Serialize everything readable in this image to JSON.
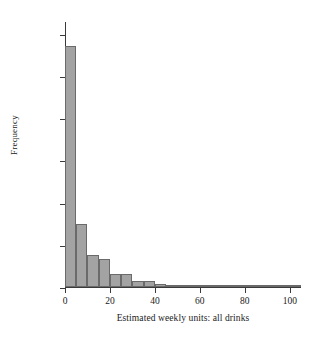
{
  "chart_data": {
    "type": "bar",
    "title": "",
    "xlabel": "Estimated weekly units: all drinks",
    "ylabel": "Frequency",
    "xlim": [
      0,
      105
    ],
    "ylim": [
      0,
      6300
    ],
    "grid": false,
    "legend": null,
    "bin_width": 5,
    "bin_starts": [
      0,
      5,
      10,
      15,
      20,
      25,
      30,
      35,
      40,
      45,
      50,
      55,
      60,
      65,
      70,
      75,
      80,
      85,
      90,
      95,
      100
    ],
    "categories": [
      "0-5",
      "5-10",
      "10-15",
      "15-20",
      "20-25",
      "25-30",
      "30-35",
      "35-40",
      "40-45",
      "45-50",
      "50-55",
      "55-60",
      "60-65",
      "65-70",
      "70-75",
      "75-80",
      "80-85",
      "85-90",
      "90-95",
      "95-100",
      "100-105"
    ],
    "values": [
      5700,
      1500,
      760,
      660,
      300,
      310,
      150,
      145,
      80,
      35,
      50,
      10,
      8,
      6,
      5,
      4,
      3,
      3,
      2,
      2,
      2
    ],
    "xticks": [
      0,
      20,
      40,
      60,
      80,
      100
    ],
    "xtick_labels": [
      "0",
      "20",
      "40",
      "60",
      "80",
      "100"
    ],
    "yticks": [
      0,
      1000,
      2000,
      3000,
      4000,
      5000,
      6000
    ],
    "ytick_labels": [
      "0",
      "1,000",
      "2,000",
      "3,000",
      "4,000",
      "5,000",
      "6,000"
    ],
    "bar_color": "#a3a3a3",
    "bar_edge_color": "#6a6a6a",
    "axis_color": "#3a3a3a",
    "background": "#ffffff"
  }
}
